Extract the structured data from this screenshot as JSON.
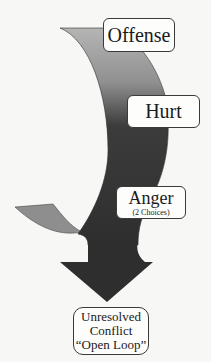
{
  "diagram": {
    "steps": [
      {
        "label": "Offense"
      },
      {
        "label": "Hurt"
      },
      {
        "label": "Anger",
        "sublabel": "(2 Choices)"
      }
    ],
    "outcome": {
      "line1": "Unresolved",
      "line2": "Conflict",
      "line3": "“Open Loop”"
    },
    "colors": {
      "band_light": "#a8a8a8",
      "band_dark": "#333333",
      "tail": "#8e8e8e",
      "arrow": "#2e2e2e",
      "background": "#f7f7f5"
    }
  }
}
